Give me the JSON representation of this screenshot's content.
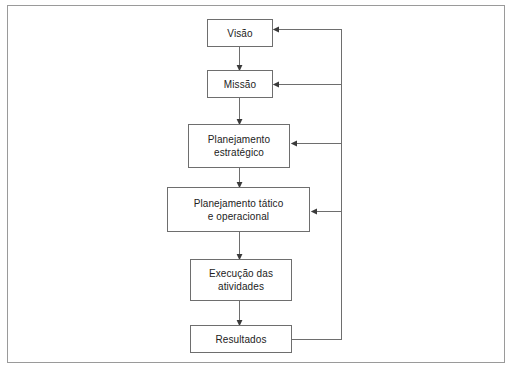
{
  "diagram": {
    "language": "pt-BR",
    "background_color": "#ffffff",
    "line_color": "#6e6e6e",
    "frame_color": "#9a9a9a",
    "text_color": "#222222",
    "nodes": [
      {
        "id": "visao",
        "label": "Visão",
        "x": 207,
        "y": 19,
        "w": 66,
        "h": 28
      },
      {
        "id": "missao",
        "label": "Missão",
        "x": 207,
        "y": 70,
        "w": 66,
        "h": 28
      },
      {
        "id": "estrategico",
        "label": "Planejamento\nestratégico",
        "x": 188,
        "y": 124,
        "w": 102,
        "h": 44
      },
      {
        "id": "tatico",
        "label": "Planejamento tático\ne operacional",
        "x": 167,
        "y": 187,
        "w": 143,
        "h": 45
      },
      {
        "id": "execucao",
        "label": "Execução das\natividades",
        "x": 190,
        "y": 259,
        "w": 102,
        "h": 42
      },
      {
        "id": "resultados",
        "label": "Resultados",
        "x": 190,
        "y": 325,
        "w": 102,
        "h": 28
      }
    ],
    "flow_connectors": [
      {
        "from": "visao",
        "to": "missao",
        "type": "arrow-down"
      },
      {
        "from": "missao",
        "to": "estrategico",
        "type": "arrow-down"
      },
      {
        "from": "estrategico",
        "to": "tatico",
        "type": "arrow-down"
      },
      {
        "from": "tatico",
        "to": "execucao",
        "type": "arrow-down"
      },
      {
        "from": "execucao",
        "to": "resultados",
        "type": "arrow-down"
      }
    ],
    "feedback_connectors": [
      {
        "from": "resultados",
        "to": "visao",
        "type": "feedback-arrow-left"
      },
      {
        "from": "resultados",
        "to": "missao",
        "type": "feedback-arrow-left"
      },
      {
        "from": "resultados",
        "to": "estrategico",
        "type": "feedback-arrow-left"
      },
      {
        "from": "resultados",
        "to": "tatico",
        "type": "feedback-arrow-left"
      }
    ]
  }
}
